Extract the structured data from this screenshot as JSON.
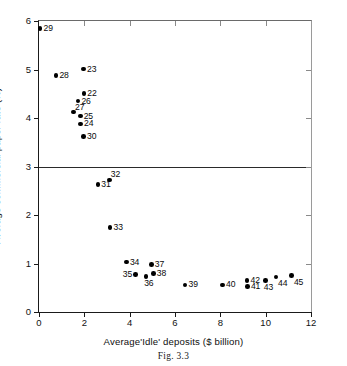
{
  "caption": "Fig. 3.3",
  "chart_data": {
    "type": "scatter",
    "title": "",
    "xlabel": "Average'Idle' deposits ($ billion)",
    "ylabel": "Average commercial paper rate (%)",
    "xlim": [
      0,
      12
    ],
    "ylim": [
      0,
      6
    ],
    "xticks": [
      0,
      2,
      4,
      6,
      8,
      10,
      12
    ],
    "yticks": [
      0,
      1,
      2,
      3,
      4,
      5,
      6
    ],
    "xtick_labels": [
      "0",
      "2",
      "4",
      "6",
      "8",
      "10",
      "12"
    ],
    "ytick_labels": [
      "0",
      "1",
      "2",
      "3",
      "4",
      "5",
      "6"
    ],
    "grid": false,
    "legend": null,
    "reference_lines": [
      {
        "axis": "y",
        "value": 3
      }
    ],
    "points": [
      {
        "label": "29",
        "x": 0.05,
        "y": 5.85,
        "label_pos": "right"
      },
      {
        "label": "28",
        "x": 0.75,
        "y": 4.88,
        "label_pos": "right"
      },
      {
        "label": "23",
        "x": 1.97,
        "y": 5.01,
        "label_pos": "right"
      },
      {
        "label": "22",
        "x": 1.98,
        "y": 4.5,
        "label_pos": "right"
      },
      {
        "label": "26",
        "x": 1.72,
        "y": 4.35,
        "label_pos": "right"
      },
      {
        "label": "27",
        "x": 1.52,
        "y": 4.12,
        "label_pos": "upper-right"
      },
      {
        "label": "25",
        "x": 1.82,
        "y": 4.04,
        "label_pos": "right"
      },
      {
        "label": "24",
        "x": 1.84,
        "y": 3.88,
        "label_pos": "right"
      },
      {
        "label": "30",
        "x": 1.97,
        "y": 3.62,
        "label_pos": "right"
      },
      {
        "label": "31",
        "x": 2.6,
        "y": 2.63,
        "label_pos": "right"
      },
      {
        "label": "32",
        "x": 3.1,
        "y": 2.72,
        "label_pos": "upper-right"
      },
      {
        "label": "33",
        "x": 3.14,
        "y": 1.74,
        "label_pos": "right"
      },
      {
        "label": "34",
        "x": 3.86,
        "y": 1.03,
        "label_pos": "right"
      },
      {
        "label": "37",
        "x": 4.96,
        "y": 0.98,
        "label_pos": "right"
      },
      {
        "label": "35",
        "x": 4.25,
        "y": 0.77,
        "label_pos": "left"
      },
      {
        "label": "36",
        "x": 4.72,
        "y": 0.73,
        "label_pos": "below"
      },
      {
        "label": "38",
        "x": 5.05,
        "y": 0.79,
        "label_pos": "right"
      },
      {
        "label": "39",
        "x": 6.45,
        "y": 0.56,
        "label_pos": "right"
      },
      {
        "label": "40",
        "x": 8.1,
        "y": 0.56,
        "label_pos": "right"
      },
      {
        "label": "42",
        "x": 9.18,
        "y": 0.65,
        "label_pos": "right"
      },
      {
        "label": "41",
        "x": 9.2,
        "y": 0.52,
        "label_pos": "right"
      },
      {
        "label": "43",
        "x": 10.0,
        "y": 0.65,
        "label_pos": "below"
      },
      {
        "label": "44",
        "x": 10.45,
        "y": 0.72,
        "label_pos": "below-right"
      },
      {
        "label": "45",
        "x": 11.15,
        "y": 0.75,
        "label_pos": "below-right"
      }
    ]
  }
}
